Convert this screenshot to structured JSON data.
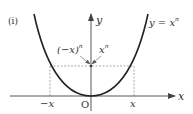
{
  "figure": {
    "panel_label": "(i)",
    "curve_label_lhs": "y",
    "curve_label_eq": " = ",
    "curve_label_base": "x",
    "curve_label_exp": "n",
    "y_axis_label": "y",
    "x_axis_label": "x",
    "origin_label": "O",
    "neg_x_label": "−x",
    "pos_x_label": "x",
    "neg_value_label_base": "(−x)",
    "neg_value_label_exp": "n",
    "pos_value_label_base": "x",
    "pos_value_label_exp": "n"
  },
  "colors": {
    "curve": "#222222",
    "axis": "#444444",
    "dashed": "#888888",
    "text": "#333333"
  }
}
